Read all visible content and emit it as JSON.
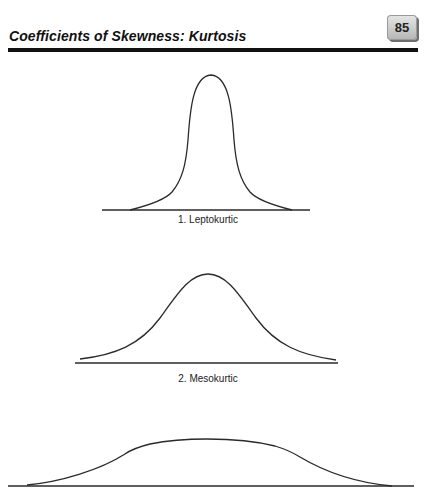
{
  "header": {
    "title": "Coefficients of Skewness: Kurtosis",
    "page_number": "85"
  },
  "figures": [
    {
      "label": "1. Leptokurtic",
      "type": "leptokurtic"
    },
    {
      "label": "2. Mesokurtic",
      "type": "mesokurtic"
    },
    {
      "label": "",
      "type": "platykurtic"
    }
  ],
  "colors": {
    "text": "#111111",
    "curve": "#2a2a2a",
    "badge": "#c9c9c9"
  }
}
